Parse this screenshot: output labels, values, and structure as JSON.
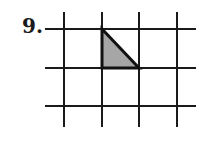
{
  "problem": {
    "number_label": "9."
  },
  "diagram": {
    "grid": {
      "vertical_lines_x": [
        64,
        102,
        139,
        177
      ],
      "horizontal_lines_y": [
        29,
        68,
        106
      ],
      "x_extent": [
        45,
        196
      ],
      "y_extent": [
        12,
        127
      ],
      "line_color": "#1a1a1a"
    },
    "shaded_triangle": {
      "vertices": [
        [
          102,
          29
        ],
        [
          102,
          68
        ],
        [
          139,
          68
        ]
      ],
      "fill": "#a6a6a6",
      "stroke": "#111111"
    }
  }
}
